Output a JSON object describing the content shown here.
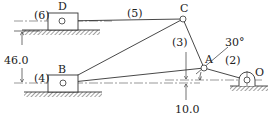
{
  "diagram": {
    "type": "mechanism-linkage",
    "points": {
      "D": {
        "label": "D"
      },
      "B": {
        "label": "B"
      },
      "C": {
        "label": "C"
      },
      "A": {
        "label": "A"
      },
      "O": {
        "label": "O"
      }
    },
    "links": {
      "l2": "(2)",
      "l3": "(3)",
      "l4": "(4)",
      "l5": "(5)",
      "l6": "(6)"
    },
    "dimensions": {
      "vertical_offset": "46.0",
      "lower_offset": "10.0",
      "crank_angle": "30°"
    }
  }
}
